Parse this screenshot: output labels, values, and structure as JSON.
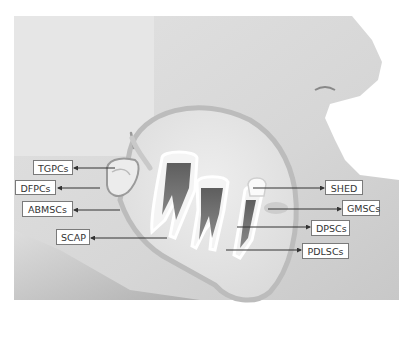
{
  "diagram": {
    "type": "anatomical-labeled-diagram",
    "background_color": "#ffffff",
    "skin_color": "#dcdcdc",
    "labels_left": [
      {
        "id": "tgpcs",
        "text": "TGPCs",
        "box": [
          33,
          160,
          40,
          15
        ],
        "arrow": [
          [
            115,
            168
          ],
          [
            73,
            168
          ]
        ]
      },
      {
        "id": "dfpcs",
        "text": "DFPCs",
        "box": [
          15,
          180,
          41,
          15
        ],
        "arrow": [
          [
            100,
            188
          ],
          [
            57,
            188
          ]
        ]
      },
      {
        "id": "abmscs",
        "text": "ABMSCs",
        "box": [
          22,
          201,
          51,
          16
        ],
        "arrow": [
          [
            120,
            210
          ],
          [
            73,
            210
          ]
        ]
      },
      {
        "id": "scap",
        "text": "SCAP",
        "box": [
          56,
          229,
          34,
          16
        ],
        "arrow": [
          [
            167,
            238
          ],
          [
            90,
            238
          ]
        ]
      }
    ],
    "labels_right": [
      {
        "id": "shed",
        "text": "SHED",
        "box": [
          325,
          180,
          38,
          15
        ],
        "arrow": [
          [
            253,
            188
          ],
          [
            325,
            188
          ]
        ]
      },
      {
        "id": "gmscs",
        "text": "GMSCs",
        "box": [
          342,
          200,
          38,
          16
        ],
        "arrow": [
          [
            268,
            209
          ],
          [
            342,
            209
          ]
        ]
      },
      {
        "id": "dpscs",
        "text": "DPSCs",
        "box": [
          311,
          220,
          39,
          16
        ],
        "arrow": [
          [
            237,
            227
          ],
          [
            311,
            227
          ]
        ]
      },
      {
        "id": "pdlscs",
        "text": "PDLSCs",
        "box": [
          302,
          243,
          47,
          16
        ],
        "arrow": [
          [
            226,
            250
          ],
          [
            302,
            250
          ]
        ]
      }
    ]
  }
}
